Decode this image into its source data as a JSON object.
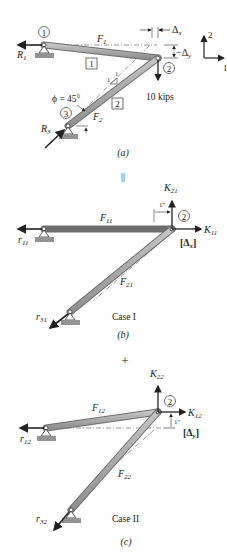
{
  "panel_a": {
    "caption": "(a)",
    "node1": "1",
    "node2": "2",
    "node3": "3",
    "member1_label": "1",
    "member2_label": "2",
    "F1": "F",
    "F1_sub": "1",
    "F2": "F",
    "F2_sub": "2",
    "R1": "R",
    "R1_sub": "1",
    "R3": "R",
    "R3_sub": "3",
    "phi": "ϕ = 45°",
    "load": "10 kips",
    "dx": "Δ",
    "dx_sub": "x",
    "dy": "−Δ",
    "dy_sub": "y",
    "slope_run": "1",
    "slope_rise": "1",
    "axis_up": "2",
    "axis_right": "1"
  },
  "equals_sign": "||",
  "panel_b": {
    "caption": "(b)",
    "case_label": "Case I",
    "node2": "2",
    "F11": "F",
    "F11_sub": "11",
    "F21": "F",
    "F21_sub": "21",
    "K11": "K",
    "K11_sub": "11",
    "K21": "K",
    "K21_sub": "21",
    "r11": "r",
    "r11_sub": "11",
    "r31": "r",
    "r31_sub": "31",
    "unit_disp": "1\"",
    "dof": "[Δ",
    "dof_sub": "x",
    "dof_close": "]"
  },
  "plus_sign": "+",
  "panel_c": {
    "caption": "(c)",
    "case_label": "Case II",
    "node2": "2",
    "F12": "F",
    "F12_sub": "12",
    "F22": "F",
    "F22_sub": "22",
    "K12": "K",
    "K12_sub": "12",
    "K22": "K",
    "K22_sub": "22",
    "r12": "r",
    "r12_sub": "12",
    "r32": "r",
    "r32_sub": "32",
    "unit_disp": "1\"",
    "dof": "[Δ",
    "dof_sub": "y",
    "dof_close": "]"
  },
  "colors": {
    "bar_fill": "#a9a9a9",
    "bar_edge": "#6e6e6e",
    "ink": "#222222",
    "ground": "#8c8c8c"
  }
}
